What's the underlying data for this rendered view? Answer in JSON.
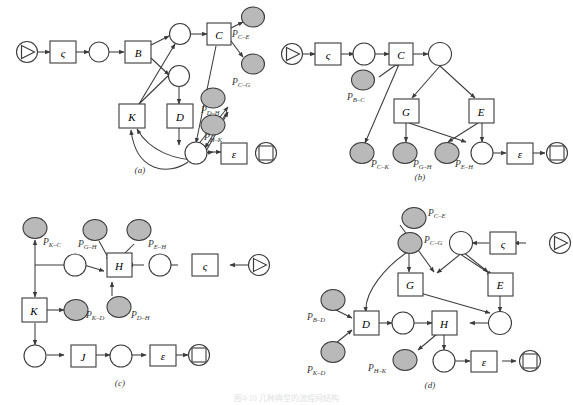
{
  "figure": {
    "caption": "图4-10 几种典型的流程网结构",
    "panel_labels": [
      "(a)",
      "(b)",
      "(c)",
      "(d)"
    ]
  },
  "legend": {
    "start_node": "start-node-circle-with-triangle",
    "end_node": "end-node-circle-with-square",
    "transition": "square-transition",
    "place": "open-circle-place",
    "shaded_place": "shaded-circle-place"
  },
  "colors": {
    "stroke": "#3b3b3b",
    "shaded_fill": "#b9b9b9",
    "open_fill": "#ffffff",
    "label_text": "#333333"
  },
  "panels": {
    "a": {
      "label": "(a)",
      "transitions": [
        "ς",
        "B",
        "C",
        "K",
        "D",
        "ε"
      ],
      "shaded_places": [
        "P_{C-E}",
        "P_{C-G}",
        "P_{D-H}",
        "P_{H-K}"
      ],
      "shaded_labels": [
        "P",
        "P",
        "P",
        "P"
      ],
      "sub_C_E": "C–E",
      "sub_C_G": "C–G",
      "sub_D_H": "D–H",
      "sub_H_K": "H–K",
      "open_place_count": 5
    },
    "b": {
      "label": "(b)",
      "transitions": [
        "ς",
        "C",
        "G",
        "E",
        "ε"
      ],
      "sub_B_C": "B–C",
      "sub_C_K": "C–K",
      "sub_G_H": "G–H",
      "sub_E_H": "E–H",
      "open_place_count": 3
    },
    "c": {
      "label": "(c)",
      "transitions": [
        "H",
        "ς",
        "K",
        "J",
        "ε"
      ],
      "sub_K_C": "K–C",
      "sub_G_H": "G–H",
      "sub_E_H": "E–H",
      "sub_K_D": "K–D",
      "sub_D_H": "D–H",
      "open_place_count": 4
    },
    "d": {
      "label": "(d)",
      "transitions": [
        "ς",
        "G",
        "E",
        "D",
        "H",
        "ε"
      ],
      "sub_C_E": "C–E",
      "sub_C_G": "C–G",
      "sub_B_D": "B–D",
      "sub_K_D": "K–D",
      "sub_H_K": "H–K",
      "open_place_count": 5
    }
  },
  "glyphs": {
    "P": "P",
    "varsigma": "ς",
    "epsilon": "ε",
    "B": "B",
    "C": "C",
    "D": "D",
    "E": "E",
    "G": "G",
    "H": "H",
    "J": "J",
    "K": "K"
  }
}
